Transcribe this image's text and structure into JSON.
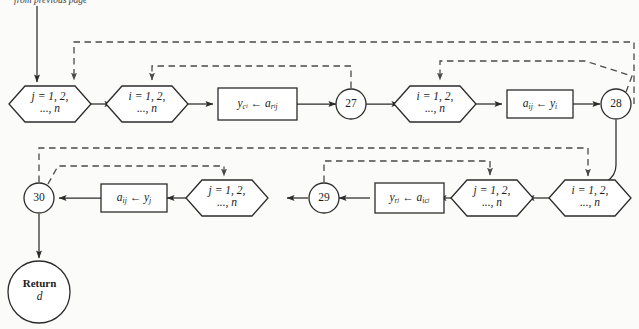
{
  "figure": {
    "type": "flowchart",
    "caption_top": "from previous page",
    "stroke_color": "#2b2b2b",
    "dashed_color": "#4a4a4a",
    "background": "#fbfbfa"
  },
  "nodes": {
    "hex_j_top": {
      "kind": "hexagon",
      "line1": "j = 1, 2,",
      "line2": "..., n",
      "var": "j"
    },
    "hex_i_top1": {
      "kind": "hexagon",
      "line1": "i = 1, 2,",
      "line2": "..., n",
      "var": "i"
    },
    "box_yc": {
      "kind": "process",
      "target": "y",
      "target_sub": "c",
      "target_sub2": "i",
      "arrow": "←",
      "source": "a",
      "source_sub": "r",
      "source_sub2": "i",
      "source_sub_tail": "j"
    },
    "conn_27": {
      "kind": "connector",
      "label": "27"
    },
    "hex_i_top2": {
      "kind": "hexagon",
      "line1": "i = 1, 2,",
      "line2": "..., n",
      "var": "i"
    },
    "box_aij_yi": {
      "kind": "process",
      "target": "a",
      "target_sub": "ij",
      "arrow": "←",
      "source": "y",
      "source_sub": "i"
    },
    "conn_28": {
      "kind": "connector",
      "label": "28"
    },
    "hex_i_bot": {
      "kind": "hexagon",
      "line1": "i = 1, 2,",
      "line2": "..., n",
      "var": "i"
    },
    "hex_j_bot1": {
      "kind": "hexagon",
      "line1": "j = 1, 2,",
      "line2": "..., n",
      "var": "j"
    },
    "box_yr": {
      "kind": "process",
      "target": "y",
      "target_sub": "r",
      "target_sub2": "j",
      "arrow": "←",
      "source": "a",
      "source_sub": "ic",
      "source_sub2": "j"
    },
    "conn_29": {
      "kind": "connector",
      "label": "29"
    },
    "hex_j_bot2": {
      "kind": "hexagon",
      "line1": "j = 1, 2,",
      "line2": "..., n",
      "var": "j"
    },
    "box_aij_yj": {
      "kind": "process",
      "target": "a",
      "target_sub": "ij",
      "arrow": "←",
      "source": "y",
      "source_sub": "j"
    },
    "conn_30": {
      "kind": "connector",
      "label": "30"
    },
    "terminal_return": {
      "kind": "terminal",
      "line1": "Return",
      "line2": "d"
    }
  },
  "edges": [
    {
      "from": "entry",
      "to": "hex_j_top",
      "style": "solid"
    },
    {
      "from": "hex_j_top",
      "to": "hex_i_top1",
      "style": "solid"
    },
    {
      "from": "hex_i_top1",
      "to": "box_yc",
      "style": "solid"
    },
    {
      "from": "box_yc",
      "to": "conn_27",
      "style": "solid"
    },
    {
      "from": "conn_27",
      "to": "hex_i_top2",
      "style": "solid"
    },
    {
      "from": "hex_i_top2",
      "to": "box_aij_yi",
      "style": "solid"
    },
    {
      "from": "box_aij_yi",
      "to": "conn_28",
      "style": "solid"
    },
    {
      "from": "conn_28",
      "to": "hex_i_bot",
      "style": "solid"
    },
    {
      "from": "hex_i_bot",
      "to": "hex_j_bot1",
      "style": "solid"
    },
    {
      "from": "hex_j_bot1",
      "to": "box_yr",
      "style": "solid"
    },
    {
      "from": "box_yr",
      "to": "conn_29",
      "style": "solid"
    },
    {
      "from": "conn_29",
      "to": "hex_j_bot2",
      "style": "solid"
    },
    {
      "from": "hex_j_bot2",
      "to": "box_aij_yj",
      "style": "solid"
    },
    {
      "from": "box_aij_yj",
      "to": "conn_30",
      "style": "solid"
    },
    {
      "from": "conn_30",
      "to": "terminal_return",
      "style": "solid"
    },
    {
      "from": "conn_27",
      "to": "hex_i_top1",
      "style": "dashed",
      "kind": "loop-back"
    },
    {
      "from": "conn_28",
      "to": "hex_j_top",
      "style": "dashed",
      "kind": "loop-back"
    },
    {
      "from": "conn_28",
      "to": "hex_i_top2",
      "style": "dashed",
      "kind": "loop-back"
    },
    {
      "from": "conn_29",
      "to": "hex_j_bot1",
      "style": "dashed",
      "kind": "loop-back"
    },
    {
      "from": "conn_30",
      "to": "hex_i_bot",
      "style": "dashed",
      "kind": "loop-back"
    },
    {
      "from": "conn_30",
      "to": "hex_j_bot2",
      "style": "dashed",
      "kind": "loop-back"
    }
  ]
}
